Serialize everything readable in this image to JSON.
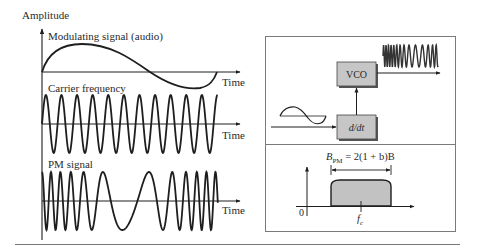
{
  "left_panel": {
    "y_axis_label": "Amplitude",
    "plots": [
      {
        "id": "modulating",
        "label": "Modulating signal (audio)",
        "x_axis_label": "Time"
      },
      {
        "id": "carrier",
        "label": "Carrier frequency",
        "x_axis_label": "Time"
      },
      {
        "id": "pm",
        "label": "PM signal",
        "x_axis_label": "Time"
      }
    ]
  },
  "right_panel": {
    "block_diagram": {
      "vco_label": "VCO",
      "diff_label": "d/dt"
    },
    "spectrum": {
      "bandwidth_formula_prefix": "B",
      "bandwidth_formula_sub": "PM",
      "bandwidth_formula_rest": " = 2(1 + b)B",
      "origin_label": "0",
      "center_label": "f",
      "center_sub": "c"
    }
  },
  "colors": {
    "line": "#1e1e1e",
    "box_fill": "#c6c6c6",
    "box_shadow": "#555555",
    "frame": "#7a7a7a",
    "spectrum_fill": "#c2c2c2"
  }
}
